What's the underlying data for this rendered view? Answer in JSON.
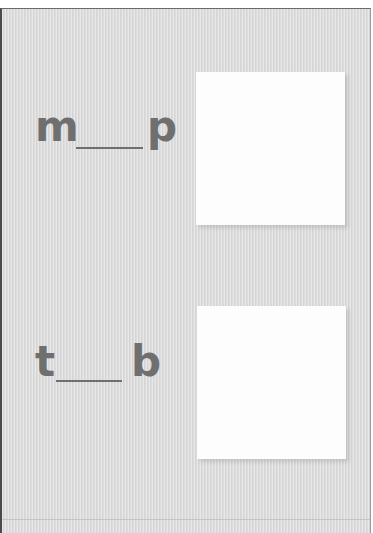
{
  "worksheet": {
    "items": [
      {
        "first_letter": "m",
        "blank": "",
        "last_letter": "p"
      },
      {
        "first_letter": "t",
        "blank": "",
        "last_letter": "b"
      }
    ]
  },
  "colors": {
    "background": "#dcdcdc",
    "text": "#6f6f6f",
    "picture_box": "#fdfdfd"
  }
}
